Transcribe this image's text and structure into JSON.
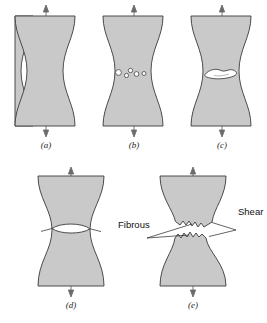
{
  "figure": {
    "background_color": "#ffffff",
    "specimen_fill": "#c9c9c9",
    "specimen_stroke": "#3a3a3a",
    "void_fill": "#ffffff",
    "arrow_color": "#6b6b6b",
    "leader_color": "#222222",
    "panels": [
      {
        "id": "a",
        "caption": "(a)",
        "stage": "initial-necking",
        "description": "Necked tensile specimen under uniaxial load",
        "features": []
      },
      {
        "id": "b",
        "caption": "(b)",
        "stage": "microvoid-formation",
        "description": "Small cavities (microvoids) form in the neck interior",
        "features": [
          "microvoids"
        ],
        "microvoid_count": 5
      },
      {
        "id": "c",
        "caption": "(c)",
        "stage": "crack-coalescence",
        "description": "Microvoids coalesce into an elliptical crack",
        "features": [
          "elliptical-crack"
        ]
      },
      {
        "id": "d",
        "caption": "(d)",
        "stage": "crack-propagation",
        "description": "Crack propagates outward perpendicular to the stress axis",
        "features": [
          "lens-crack"
        ]
      },
      {
        "id": "e",
        "caption": "(e)",
        "stage": "final-shear-fracture",
        "description": "Final shear fracture at 45 degrees producing cup-and-cone surfaces",
        "features": [
          "fibrous-region",
          "shear-lip"
        ]
      }
    ],
    "annotations": [
      {
        "id": "fibrous",
        "label": "Fibrous",
        "panel": "e"
      },
      {
        "id": "shear",
        "label": "Shear",
        "panel": "e"
      }
    ]
  }
}
